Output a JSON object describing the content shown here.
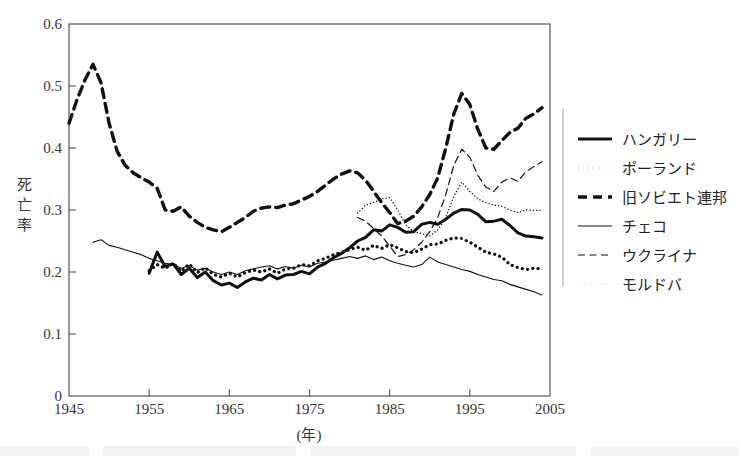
{
  "chart_data": {
    "type": "line",
    "title": "",
    "xlabel": "(年)",
    "ylabel": "死亡率",
    "xlim": [
      1945,
      2005
    ],
    "ylim": [
      0,
      0.6
    ],
    "xticks": [
      1945,
      1955,
      1965,
      1975,
      1985,
      1995,
      2005
    ],
    "xtick_labels": [
      "1945",
      "1955",
      "1965",
      "1975",
      "1985",
      "1995",
      "2005"
    ],
    "yticks": [
      0,
      0.1,
      0.2,
      0.3,
      0.4,
      0.5,
      0.6
    ],
    "ytick_labels": [
      "0",
      "0.1",
      "0.2",
      "0.3",
      "0.4",
      "0.5",
      "0.6"
    ],
    "grid": false,
    "legend_position": "right",
    "series": [
      {
        "name": "ハンガリー",
        "style": "solid-thick",
        "color": "#111111",
        "x": [
          1955,
          1956,
          1957,
          1958,
          1959,
          1960,
          1961,
          1962,
          1963,
          1964,
          1965,
          1966,
          1967,
          1968,
          1969,
          1970,
          1971,
          1972,
          1973,
          1974,
          1975,
          1976,
          1977,
          1978,
          1979,
          1980,
          1981,
          1982,
          1983,
          1984,
          1985,
          1986,
          1987,
          1988,
          1989,
          1990,
          1991,
          1992,
          1993,
          1994,
          1995,
          1996,
          1997,
          1998,
          1999,
          2000,
          2001,
          2002,
          2003,
          2004
        ],
        "y": [
          0.198,
          0.232,
          0.209,
          0.213,
          0.196,
          0.206,
          0.191,
          0.2,
          0.186,
          0.179,
          0.182,
          0.175,
          0.184,
          0.19,
          0.187,
          0.196,
          0.189,
          0.195,
          0.196,
          0.201,
          0.197,
          0.208,
          0.214,
          0.223,
          0.23,
          0.239,
          0.25,
          0.256,
          0.268,
          0.266,
          0.276,
          0.272,
          0.264,
          0.265,
          0.277,
          0.28,
          0.277,
          0.285,
          0.295,
          0.301,
          0.3,
          0.293,
          0.281,
          0.282,
          0.285,
          0.275,
          0.263,
          0.258,
          0.257,
          0.255
        ]
      },
      {
        "name": "ポーランド",
        "style": "dotted-thick",
        "color": "#111111",
        "x": [
          1955,
          1956,
          1957,
          1958,
          1959,
          1960,
          1961,
          1962,
          1963,
          1964,
          1965,
          1966,
          1967,
          1968,
          1969,
          1970,
          1971,
          1972,
          1973,
          1974,
          1975,
          1976,
          1977,
          1978,
          1979,
          1980,
          1981,
          1982,
          1983,
          1984,
          1985,
          1986,
          1987,
          1988,
          1989,
          1990,
          1991,
          1992,
          1993,
          1994,
          1995,
          1996,
          1997,
          1998,
          1999,
          2000,
          2001,
          2002,
          2003,
          2004
        ],
        "y": [
          0.202,
          0.212,
          0.206,
          0.214,
          0.201,
          0.213,
          0.199,
          0.207,
          0.196,
          0.192,
          0.198,
          0.192,
          0.199,
          0.203,
          0.2,
          0.205,
          0.198,
          0.205,
          0.206,
          0.212,
          0.21,
          0.218,
          0.222,
          0.228,
          0.232,
          0.236,
          0.24,
          0.235,
          0.243,
          0.238,
          0.244,
          0.239,
          0.233,
          0.231,
          0.237,
          0.244,
          0.245,
          0.251,
          0.255,
          0.254,
          0.248,
          0.24,
          0.232,
          0.229,
          0.224,
          0.212,
          0.207,
          0.204,
          0.206,
          0.205
        ]
      },
      {
        "name": "旧ソビエト連邦",
        "style": "dashed-thick",
        "color": "#111111",
        "x": [
          1945,
          1946,
          1947,
          1948,
          1949,
          1950,
          1951,
          1952,
          1953,
          1954,
          1955,
          1956,
          1957,
          1958,
          1959,
          1960,
          1961,
          1962,
          1963,
          1964,
          1965,
          1966,
          1967,
          1968,
          1969,
          1970,
          1971,
          1972,
          1973,
          1974,
          1975,
          1976,
          1977,
          1978,
          1979,
          1980,
          1981,
          1982,
          1983,
          1984,
          1985,
          1986,
          1987,
          1988,
          1989,
          1990,
          1991,
          1992,
          1993,
          1994,
          1995,
          1996,
          1997,
          1998,
          1999,
          2000,
          2001,
          2002,
          2003,
          2004
        ],
        "y": [
          0.44,
          0.478,
          0.51,
          0.535,
          0.505,
          0.44,
          0.395,
          0.372,
          0.36,
          0.352,
          0.345,
          0.335,
          0.3,
          0.298,
          0.305,
          0.29,
          0.28,
          0.272,
          0.268,
          0.265,
          0.272,
          0.28,
          0.288,
          0.298,
          0.303,
          0.305,
          0.304,
          0.308,
          0.31,
          0.316,
          0.322,
          0.33,
          0.34,
          0.35,
          0.358,
          0.363,
          0.36,
          0.348,
          0.33,
          0.312,
          0.296,
          0.278,
          0.282,
          0.29,
          0.305,
          0.325,
          0.352,
          0.4,
          0.455,
          0.488,
          0.47,
          0.43,
          0.4,
          0.398,
          0.412,
          0.425,
          0.432,
          0.448,
          0.455,
          0.465
        ]
      },
      {
        "name": "チェコ",
        "style": "solid-thin",
        "color": "#111111",
        "x": [
          1948,
          1949,
          1950,
          1951,
          1952,
          1953,
          1954,
          1955,
          1956,
          1957,
          1958,
          1959,
          1960,
          1961,
          1962,
          1963,
          1964,
          1965,
          1966,
          1967,
          1968,
          1969,
          1970,
          1971,
          1972,
          1973,
          1974,
          1975,
          1976,
          1977,
          1978,
          1979,
          1980,
          1981,
          1982,
          1983,
          1984,
          1985,
          1986,
          1987,
          1988,
          1989,
          1990,
          1991,
          1992,
          1993,
          1994,
          1995,
          1996,
          1997,
          1998,
          1999,
          2000,
          2001,
          2002,
          2003,
          2004
        ],
        "y": [
          0.248,
          0.252,
          0.243,
          0.24,
          0.236,
          0.232,
          0.228,
          0.222,
          0.218,
          0.214,
          0.212,
          0.206,
          0.21,
          0.203,
          0.206,
          0.2,
          0.196,
          0.2,
          0.196,
          0.202,
          0.205,
          0.208,
          0.21,
          0.205,
          0.209,
          0.206,
          0.211,
          0.208,
          0.214,
          0.216,
          0.219,
          0.222,
          0.225,
          0.222,
          0.226,
          0.22,
          0.224,
          0.218,
          0.214,
          0.211,
          0.208,
          0.212,
          0.224,
          0.216,
          0.212,
          0.208,
          0.204,
          0.201,
          0.196,
          0.192,
          0.188,
          0.186,
          0.18,
          0.176,
          0.172,
          0.168,
          0.163
        ]
      },
      {
        "name": "ウクライナ",
        "style": "dashed-thin",
        "color": "#111111",
        "x": [
          1981,
          1982,
          1983,
          1984,
          1985,
          1986,
          1987,
          1988,
          1989,
          1990,
          1991,
          1992,
          1993,
          1994,
          1995,
          1996,
          1997,
          1998,
          1999,
          2000,
          2001,
          2002,
          2003,
          2004
        ],
        "y": [
          0.288,
          0.282,
          0.27,
          0.258,
          0.242,
          0.225,
          0.228,
          0.236,
          0.248,
          0.265,
          0.288,
          0.325,
          0.372,
          0.398,
          0.385,
          0.356,
          0.337,
          0.33,
          0.345,
          0.352,
          0.346,
          0.362,
          0.37,
          0.378
        ]
      },
      {
        "name": "モルドバ",
        "style": "dotted-thin",
        "color": "#111111",
        "x": [
          1981,
          1982,
          1983,
          1984,
          1985,
          1986,
          1987,
          1988,
          1989,
          1990,
          1991,
          1992,
          1993,
          1994,
          1995,
          1996,
          1997,
          1998,
          1999,
          2000,
          2001,
          2002,
          2003,
          2004
        ],
        "y": [
          0.295,
          0.308,
          0.312,
          0.318,
          0.32,
          0.3,
          0.276,
          0.265,
          0.262,
          0.258,
          0.268,
          0.288,
          0.322,
          0.345,
          0.33,
          0.318,
          0.312,
          0.308,
          0.306,
          0.3,
          0.296,
          0.3,
          0.299,
          0.3
        ]
      }
    ]
  },
  "axes": {
    "y_label_chars": [
      "死",
      "亡",
      "率"
    ],
    "x_label": "(年)"
  },
  "legend": {
    "items": [
      {
        "label": "ハンガリー",
        "style": "solid-thick"
      },
      {
        "label": "ポーランド",
        "style": "dotted-thick"
      },
      {
        "label": "旧ソビエト連邦",
        "style": "dashed-thick"
      },
      {
        "label": "チェコ",
        "style": "solid-thin"
      },
      {
        "label": "ウクライナ",
        "style": "dashed-thin"
      },
      {
        "label": "モルドバ",
        "style": "dotted-thin"
      }
    ]
  }
}
